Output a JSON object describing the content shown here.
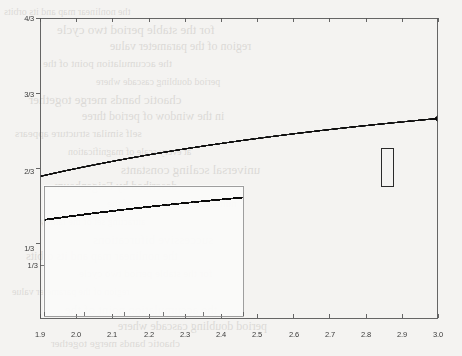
{
  "figure": {
    "background_color": "#f4f3f1",
    "ink_color": "#3a3a3a",
    "axis_color": "#555555"
  },
  "chart_data": {
    "type": "scatter",
    "subtitle": "",
    "xlabel": "",
    "ylabel": "",
    "xlim": [
      1.9,
      3.0
    ],
    "ylim": [
      0,
      1.3333333
    ],
    "grid": false,
    "legend": null,
    "map": {
      "name": "quadratic-map",
      "formula": "x_{n+1} = r * x_n * (1 - x_n) scaled",
      "parameter_symbol": "r"
    },
    "x_ticks": [
      1.9,
      2.0,
      2.1,
      2.2,
      2.3,
      2.4,
      2.5,
      2.6,
      2.7,
      2.8,
      2.9,
      3.0
    ],
    "x_tick_labels": [
      "1.9",
      "2.0",
      "2.1",
      "2.2",
      "2.3",
      "2.4",
      "2.5",
      "2.6",
      "2.7",
      "2.8",
      "2.9",
      "3.0"
    ],
    "y_ticks": [
      0.3333333,
      0.6666667,
      1.0,
      1.3333333
    ],
    "y_tick_labels": [
      "1/3",
      "2/3",
      "3/3",
      "4/3"
    ],
    "features": {
      "fixed_point_branch_end": 2.0,
      "first_bifurcation": 2.0,
      "second_bifurcation": 2.449,
      "third_bifurcation": 2.544,
      "fourth_bifurcation": 2.564,
      "accumulation_point": 2.5699,
      "chaos_onset": 2.57,
      "periodic_windows": [
        {
          "center": 2.63,
          "width": 0.018,
          "period": 6
        },
        {
          "center": 2.741,
          "width": 0.022,
          "period": 5
        },
        {
          "center": 2.8285,
          "width": 0.058,
          "period": 3
        },
        {
          "center": 2.932,
          "width": 0.016,
          "period": 5
        }
      ],
      "band_merge_points": [
        2.679,
        2.593,
        2.575
      ]
    },
    "sampling": {
      "parameter_steps": 1150,
      "transient_iterations": 320,
      "plotted_iterations": 180
    },
    "inset": {
      "type": "scatter",
      "xlim": [
        1.9,
        2.4
      ],
      "ylim": [
        0.0,
        0.85
      ],
      "x_ticks": [
        1.9,
        2.0,
        2.1,
        2.2,
        2.3,
        2.4
      ],
      "x_tick_labels": [
        "1.9",
        "2.0",
        "2.1",
        "2.2",
        "2.3",
        "2.4"
      ],
      "y_ticks": [
        0.3333333
      ],
      "y_tick_labels": [
        "1/3"
      ],
      "note": "magnified view of the lower-left region"
    },
    "highlight_box": {
      "x_range": [
        2.842,
        2.876
      ],
      "y_range": [
        0.585,
        0.755
      ],
      "note": "small rectangle marking a magnified sub-region inside the chaotic band"
    }
  },
  "axes": {
    "main": {
      "y_labels": [
        "4/3",
        "3/3",
        "2/3",
        "1/3"
      ],
      "x_labels": [
        "1.9",
        "2.0",
        "2.1",
        "2.2",
        "2.3",
        "2.4",
        "2.5",
        "2.6",
        "2.7",
        "2.8",
        "2.9",
        "3.0"
      ]
    },
    "inset": {
      "y_labels": [
        "1/3"
      ],
      "x_labels": [
        "1.9",
        "2.0",
        "2.1",
        "2.2",
        "2.3",
        "2.4"
      ]
    }
  },
  "page_bleed_text": {
    "note": "faint mirrored text showing through from the reverse side of the scanned page",
    "lines": [
      "the nonlinear map and its orbits",
      "for the stable period two cycle",
      "region of the parameter value",
      "the accumulation point of the",
      "period doubling cascade where",
      "chaotic bands merge together",
      "in the window of period three",
      "self similar structure appears",
      "at every scale of magnification",
      "universal scaling constants",
      "described by Feigenbaum",
      "numerical computation of the",
      "attracting set of the family",
      "successive bifurcations"
    ]
  }
}
